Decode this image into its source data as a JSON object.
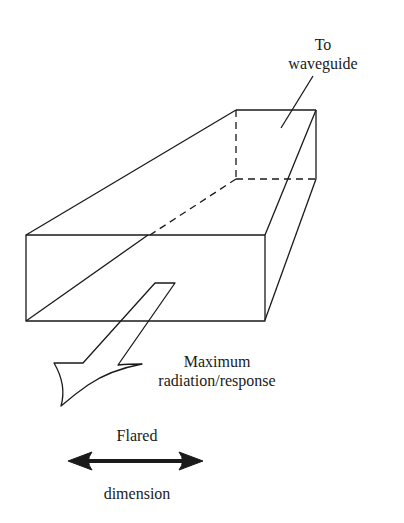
{
  "diagram": {
    "labels": {
      "to_waveguide_line1": "To",
      "to_waveguide_line2": "waveguide",
      "max_line1": "Maximum",
      "max_line2": "radiation/response",
      "flared": "Flared",
      "dimension": "dimension"
    },
    "colors": {
      "stroke": "#1a1a1a",
      "background": "#ffffff"
    }
  }
}
